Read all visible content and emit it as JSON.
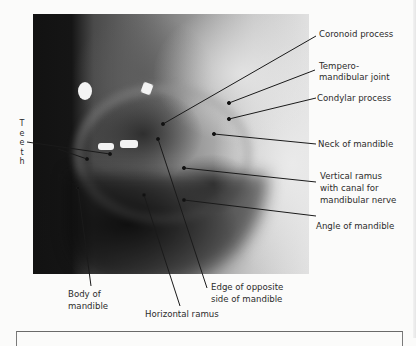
{
  "figure": {
    "image_description": "Lateral oblique radiograph of the mandible",
    "labels": {
      "coronoid_process": "Coronoid process",
      "tmj_line1": "Tempero-",
      "tmj_line2": "mandibular joint",
      "condylar_process": "Condylar process",
      "neck_of_mandible": "Neck of mandible",
      "vertical_ramus_line1": "Vertical ramus",
      "vertical_ramus_line2": "with canal for",
      "vertical_ramus_line3": "mandibular nerve",
      "angle_of_mandible": "Angle of mandible",
      "teeth_letters": [
        "T",
        "e",
        "e",
        "t",
        "h"
      ],
      "body_line1": "Body of",
      "body_line2": "mandible",
      "horizontal_ramus": "Horizontal ramus",
      "edge_line1": "Edge of opposite",
      "edge_line2": "side of mandible"
    }
  }
}
